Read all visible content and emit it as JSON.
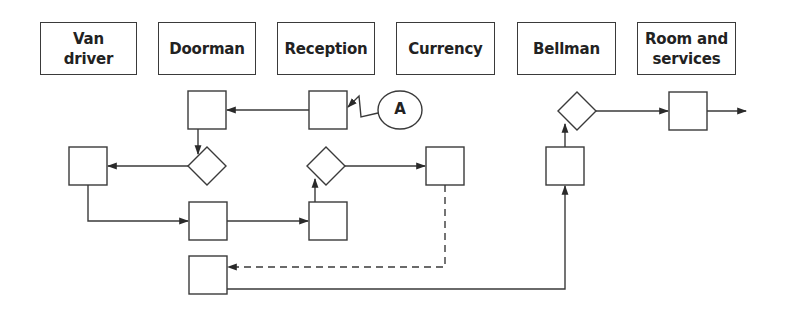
{
  "diagram": {
    "type": "service flowchart with swimlanes",
    "lanes": [
      {
        "label": "Van\ndriver"
      },
      {
        "label": "Doorman"
      },
      {
        "label": "Reception"
      },
      {
        "label": "Currency"
      },
      {
        "label": "Bellman"
      },
      {
        "label": "Room and\nservices"
      }
    ],
    "connector_label": "A",
    "colors": {
      "stroke": "#3a3a3a",
      "text": "#222222",
      "background": "#ffffff"
    }
  }
}
